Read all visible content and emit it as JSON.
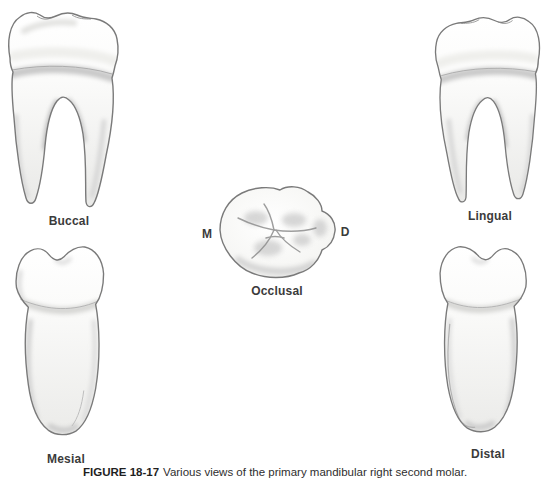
{
  "figure": {
    "views": [
      {
        "id": "buccal",
        "label": "Buccal"
      },
      {
        "id": "lingual",
        "label": "Lingual"
      },
      {
        "id": "occlusal",
        "label": "Occlusal",
        "mesial_marker": "M",
        "distal_marker": "D"
      },
      {
        "id": "mesial",
        "label": "Mesial"
      },
      {
        "id": "distal",
        "label": "Distal"
      }
    ],
    "caption": {
      "number": "FIGURE 18-17",
      "text": "Various views of the primary mandibular right second molar."
    },
    "colors": {
      "background": "#ffffff",
      "tooth_outline": "#7a7a7a",
      "tooth_shading": "#c8c8c8",
      "label_text": "#3b3b3b"
    }
  }
}
